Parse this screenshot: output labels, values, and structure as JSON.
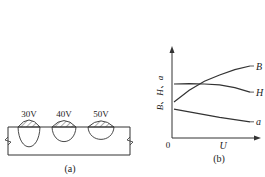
{
  "panel_a": {
    "caption": "(a)",
    "beads": [
      {
        "label": "30V",
        "reinforcement": 0.5,
        "penetration": 1.0
      },
      {
        "label": "40V",
        "reinforcement": 0.4,
        "penetration": 0.65
      },
      {
        "label": "50V",
        "reinforcement": 0.35,
        "penetration": 0.5
      }
    ]
  },
  "panel_b": {
    "caption": "(b)",
    "chart_data": {
      "type": "line",
      "title": "",
      "xlabel": "U",
      "ylabel": "B、H、a",
      "origin_label": "0",
      "xlim": [
        0,
        10
      ],
      "ylim": [
        0,
        10
      ],
      "grid": false,
      "legend": "inline-right",
      "x": [
        0,
        2,
        4,
        6,
        8,
        10
      ],
      "series": [
        {
          "name": "B",
          "values": [
            4.0,
            5.3,
            6.3,
            7.0,
            7.6,
            8.0
          ]
        },
        {
          "name": "H",
          "values": [
            6.0,
            6.05,
            6.0,
            5.9,
            5.6,
            5.1
          ]
        },
        {
          "name": "a",
          "values": [
            3.2,
            2.9,
            2.6,
            2.3,
            2.05,
            1.8
          ]
        }
      ]
    }
  }
}
